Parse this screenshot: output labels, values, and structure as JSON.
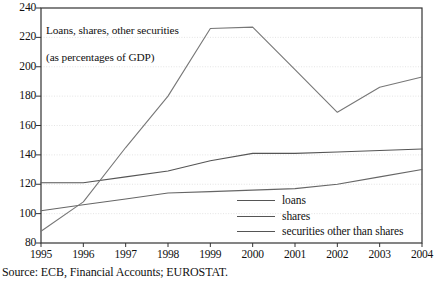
{
  "chart_data": {
    "type": "line",
    "title": "Loans, shares, other securities\n(as percentages of GDP)",
    "title_line1": "Loans, shares, other securities",
    "title_line2": "(as percentages of GDP)",
    "xlabel": "",
    "ylabel": "",
    "x": [
      1995,
      1996,
      1997,
      1998,
      1999,
      2000,
      2001,
      2002,
      2003,
      2004
    ],
    "categories": [
      "1995",
      "1996",
      "1997",
      "1998",
      "1999",
      "2000",
      "2001",
      "2002",
      "2003",
      "2004"
    ],
    "xlim": [
      1995,
      2004
    ],
    "ylim": [
      80,
      240
    ],
    "yticks": [
      80,
      100,
      120,
      140,
      160,
      180,
      200,
      220,
      240
    ],
    "ytick_labels": [
      "80",
      "100",
      "120",
      "140",
      "160",
      "180",
      "200",
      "220",
      "240"
    ],
    "grid": true,
    "grid_axis": "y",
    "legend_position": "lower right",
    "series": [
      {
        "name": "loans",
        "color": "#555555",
        "values": [
          121,
          121,
          125,
          129,
          136,
          141,
          141,
          142,
          143,
          144
        ]
      },
      {
        "name": "shares",
        "color": "#666666",
        "values": [
          102,
          106,
          110,
          114,
          115,
          116,
          117,
          120,
          125,
          130
        ]
      },
      {
        "name": "securities other than shares",
        "color": "#777777",
        "values": [
          88,
          108,
          145,
          180,
          226,
          227,
          198,
          169,
          186,
          193
        ]
      }
    ]
  },
  "legend": {
    "entries": [
      {
        "label": "loans"
      },
      {
        "label": "shares"
      },
      {
        "label": "securities other than shares"
      }
    ]
  },
  "source": {
    "note": "Source: ECB, Financial Accounts; EUROSTAT."
  },
  "colors": {
    "axis": "#333333",
    "grid": "#d9d9d9",
    "line": "#555555",
    "text": "#111111",
    "background": "#ffffff"
  }
}
